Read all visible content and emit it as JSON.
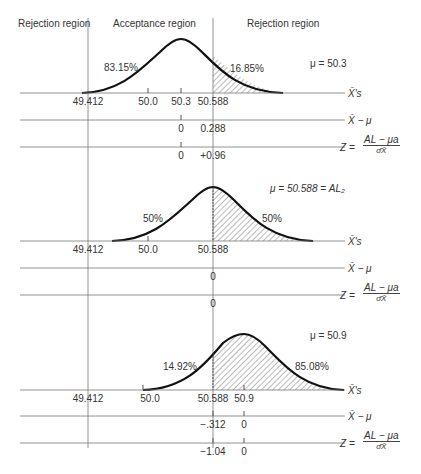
{
  "regions": {
    "left": "Rejection region",
    "middle": "Acceptance region",
    "right": "Rejection region"
  },
  "axis_labels": {
    "xbar": "X̄'s",
    "xbar_minus_mu": "X̄ − μ",
    "z_prefix": "Z =",
    "z_numerator": "AL − μa",
    "z_denominator": "σ̂X̄"
  },
  "panels": [
    {
      "mu_label": "μ = 50.3",
      "left_pct": "83.15%",
      "right_pct": "16.85%",
      "x_ticks": [
        "49.412",
        "50.0",
        "50.3",
        "50.588"
      ],
      "diff_ticks": [
        "0",
        "0.288"
      ],
      "z_ticks": [
        "0",
        "+0.96"
      ]
    },
    {
      "mu_label": "μ = 50.588 = AL₂",
      "left_pct": "50%",
      "right_pct": "50%",
      "x_ticks": [
        "49.412",
        "50.0",
        "50.588"
      ],
      "diff_ticks": [
        "0"
      ],
      "z_ticks": [
        "0"
      ]
    },
    {
      "mu_label": "μ = 50.9",
      "left_pct": "14.92%",
      "right_pct": "85.08%",
      "x_ticks": [
        "49.412",
        "50.0",
        "50.588",
        "50.9"
      ],
      "diff_ticks": [
        "−.312",
        "0"
      ],
      "z_ticks": [
        "−1.04",
        "0"
      ]
    }
  ]
}
